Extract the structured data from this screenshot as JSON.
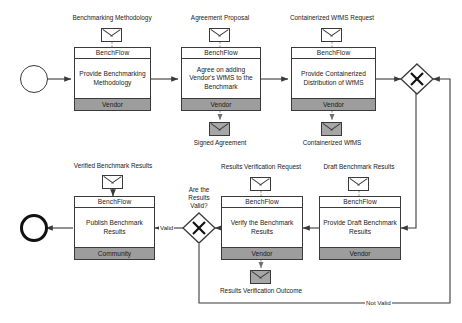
{
  "diagram": {
    "type": "bpmn-collaboration",
    "colors": {
      "stroke": "#3a3a3a",
      "lane_fill": "#9d9d9d",
      "data_out_fill": "#a6a6a6",
      "background": "#ffffff",
      "end_event_stroke": "#111111"
    },
    "events": [
      {
        "id": "start",
        "name": "start-event",
        "shape": "circle-thin"
      },
      {
        "id": "end",
        "name": "end-event",
        "shape": "circle-thick"
      }
    ],
    "gateways": [
      {
        "id": "gw_top",
        "kind": "exclusive",
        "label": ""
      },
      {
        "id": "gw_bottom",
        "kind": "exclusive",
        "label": "Are the Results Valid?"
      }
    ],
    "tasks": [
      {
        "id": "t1",
        "pool": "BenchFlow",
        "name": "Provide Benchmarking Methodology",
        "role": "Vendor"
      },
      {
        "id": "t2",
        "pool": "BenchFlow",
        "name": "Agree on adding Vendor's WfMS to the Benchmark",
        "role": "Vendor"
      },
      {
        "id": "t3",
        "pool": "BenchFlow",
        "name": "Provide Containerized Distribution of WfMS",
        "role": "Vendor"
      },
      {
        "id": "t4",
        "pool": "BenchFlow",
        "name": "Publish Benchmark Results",
        "role": "Community"
      },
      {
        "id": "t5",
        "pool": "BenchFlow",
        "name": "Verify the Benchmark Results",
        "role": "Vendor"
      },
      {
        "id": "t6",
        "pool": "BenchFlow",
        "name": "Provide Draft Benchmark Results",
        "role": "Vendor"
      }
    ],
    "data_objects": [
      {
        "id": "d1",
        "label": "Benchmarking Methodology",
        "direction": "input",
        "style": "white"
      },
      {
        "id": "d2",
        "label": "Agreement Proposal",
        "direction": "input",
        "style": "white"
      },
      {
        "id": "d3",
        "label": "Containerized WfMS Request",
        "direction": "input",
        "style": "white"
      },
      {
        "id": "d4",
        "label": "Signed Agreement",
        "direction": "output",
        "style": "shaded"
      },
      {
        "id": "d5",
        "label": "Containerized WfMS",
        "direction": "output",
        "style": "shaded"
      },
      {
        "id": "d6",
        "label": "Verified Benchmark Results",
        "direction": "input",
        "style": "white"
      },
      {
        "id": "d7",
        "label": "Results Verification Request",
        "direction": "input",
        "style": "white"
      },
      {
        "id": "d8",
        "label": "Draft Benchmark Results",
        "direction": "input",
        "style": "white"
      },
      {
        "id": "d9",
        "label": "Results Verification Outcome",
        "direction": "output",
        "style": "shaded"
      }
    ],
    "flow_labels": [
      {
        "id": "f_valid",
        "text": "Valid"
      },
      {
        "id": "f_notvalid",
        "text": "Not Valid"
      }
    ],
    "gateway_question": {
      "line1": "Are the",
      "line2": "Results",
      "line3": "Valid?"
    }
  }
}
